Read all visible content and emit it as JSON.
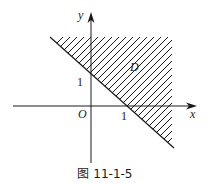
{
  "figure": {
    "caption": "图 11-1-5",
    "axes": {
      "x_label": "x",
      "y_label": "y",
      "origin_label": "O",
      "x_tick_label": "1",
      "y_tick_label": "1"
    },
    "region_label": "D",
    "boundary_line": "x + y = 1",
    "region_description": "Hatched region D above/right of the line x + y = 1",
    "colors": {
      "ink": "#1a1a1a",
      "background": "#ffffff"
    }
  }
}
